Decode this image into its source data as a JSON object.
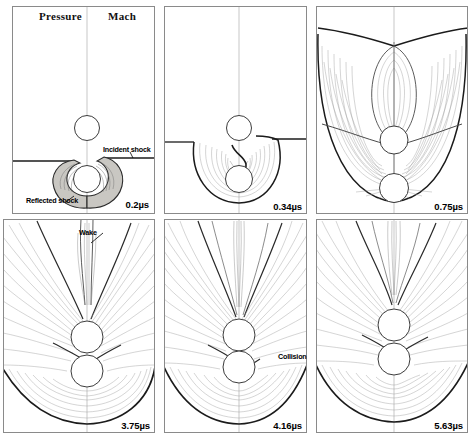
{
  "figure": {
    "kind": "cfd-contour-panel-sequence",
    "columns": 3,
    "rows": 2,
    "halves": {
      "left_label": "Pressure",
      "right_label": "Mach"
    }
  },
  "headers": {
    "pressure": "Pressure",
    "mach": "Mach"
  },
  "annotations": {
    "incident_shock": "Incident shock",
    "reflected_shock": "Reflected shock",
    "wake": "Wake",
    "collision": "Collision"
  },
  "panels": [
    {
      "id": "panel-1",
      "time_value": "0.2",
      "time_unit": "µs",
      "time_label": "0.2µs",
      "has_headers": true,
      "annotations": [
        "incident_shock",
        "reflected_shock"
      ],
      "description": "Planar incident shock impinges on lower sphere; shaded crescent reflected shock wraps the lower circle.",
      "stage": "incident-shock-impact"
    },
    {
      "id": "panel-2",
      "time_value": "0.34",
      "time_unit": "µs",
      "time_label": "0.34µs",
      "has_headers": false,
      "annotations": [],
      "description": "Diffracted shock expands into a semicircular bowl enveloping both spheres; fan contours emanate between them.",
      "stage": "shock-diffraction"
    },
    {
      "id": "panel-3",
      "time_value": "0.75",
      "time_unit": "µs",
      "time_label": "0.75µs",
      "has_headers": false,
      "annotations": [],
      "description": "Large bowl-shaped shock front fills the frame; a tall plume lobe forms above the upper sphere.",
      "stage": "plume-formation"
    },
    {
      "id": "panel-4",
      "time_value": "3.75",
      "time_unit": "µs",
      "time_label": "3.75µs",
      "has_headers": false,
      "annotations": [
        "wake"
      ],
      "description": "Elongated wake jet streams upward from the spheres; broad curved shock remains at the bottom.",
      "stage": "wake-development"
    },
    {
      "id": "panel-5",
      "time_value": "4.16",
      "time_unit": "µs",
      "time_label": "4.16µs",
      "has_headers": false,
      "annotations": [
        "collision"
      ],
      "description": "Spheres approach contact; collision point marked between the two circles.",
      "stage": "particle-collision"
    },
    {
      "id": "panel-6",
      "time_value": "5.63",
      "time_unit": "µs",
      "time_label": "5.63µs",
      "has_headers": false,
      "annotations": [],
      "description": "Post-collision radial contour fan with a narrowed upward jet and smooth lower shock arc.",
      "stage": "post-collision"
    }
  ],
  "colors": {
    "background": "#ffffff",
    "frame": "#8a8a8a",
    "contour_light": "#9a9a9a",
    "contour_mid": "#6b6b6b",
    "shock_dark": "#1a1a1a",
    "shade_fill": "#c9c7c2",
    "text": "#000000"
  }
}
